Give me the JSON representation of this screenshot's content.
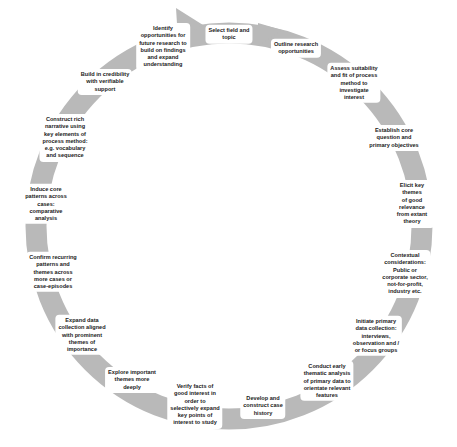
{
  "diagram": {
    "type": "cycle",
    "ring_color": "#b8b8b8",
    "text_color": "#222222",
    "center": [
      229,
      226
    ],
    "steps": [
      {
        "label": "Select field and\ntopic",
        "x": 229,
        "y": 34
      },
      {
        "label": "Outline research\nopportunities",
        "x": 296,
        "y": 48
      },
      {
        "label": "Assess suitability\nand fit of process\nmethod to\ninvestigate\ninterest",
        "x": 354,
        "y": 83
      },
      {
        "label": "Establish core\nquestion and\nprimary objectives",
        "x": 394,
        "y": 138
      },
      {
        "label": "Elicit key themes\nof good relevance\nfrom extant\ntheory",
        "x": 412,
        "y": 204
      },
      {
        "label": "Contextual\nconsiderations:\nPublic or\ncorporate sector,\nnot-for-profit,\nindustry etc.",
        "x": 405,
        "y": 274
      },
      {
        "label": "Initiate primary\ndata collection:\ninterviews,\nobservation and /\nor focus groups",
        "x": 376,
        "y": 336
      },
      {
        "label": "Conduct early\nthematic analysis\nof primary data to\norientate relevant\nfeatures",
        "x": 327,
        "y": 381
      },
      {
        "label": "Develop and\nconstruct case\nhistory",
        "x": 263,
        "y": 406
      },
      {
        "label": "Verify facts of\ngood interest in\norder to\nselectively expand\nkey points of\ninterest to study",
        "x": 195,
        "y": 405
      },
      {
        "label": "Explore important\nthemes more\ndeeply",
        "x": 132,
        "y": 380
      },
      {
        "label": "Expand data\ncollection aligned\nwith prominent\nthemes of\nimportance",
        "x": 82,
        "y": 335
      },
      {
        "label": "Confirm recurring\npatterns and\nthemes across\nmore cases or\ncase-episodes",
        "x": 53,
        "y": 272
      },
      {
        "label": "Induce core\npatterns across\ncases:\ncomparative\nanalysis",
        "x": 46,
        "y": 204
      },
      {
        "label": "Construct rich\nnarrative using\nkey elements of\nprocess method:\ne.g. vocabulary\nand sequence",
        "x": 65,
        "y": 138
      },
      {
        "label": "Build in credibility\nwith verifiable\nsupport",
        "x": 105,
        "y": 82
      },
      {
        "label": "Identify\nopportunities for\nfuture research to\nbuild on findings\nand expand\nunderstanding",
        "x": 163,
        "y": 47
      }
    ]
  }
}
